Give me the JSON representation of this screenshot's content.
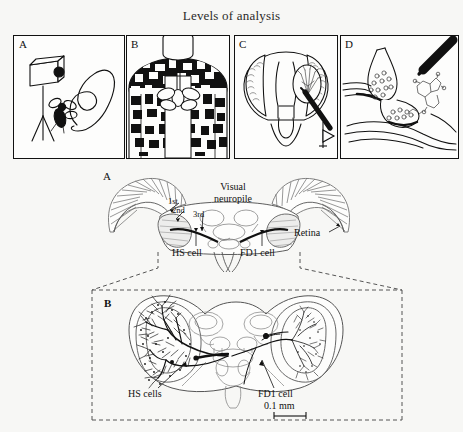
{
  "figure": {
    "title": "Levels of analysis",
    "background_color": "#f7f7f5",
    "ink_color": "#111111"
  },
  "top_row": {
    "panels": [
      {
        "letter": "A",
        "subject": "behaving-fly-with-camera",
        "contents": [
          "video-camera-on-tripod",
          "fly",
          "flight-trajectory-loop"
        ]
      },
      {
        "letter": "B",
        "subject": "fly-in-striped-flight-arena",
        "contents": [
          "rotating-drum",
          "random-checkerboard-pattern",
          "tethered-fly"
        ]
      },
      {
        "letter": "C",
        "subject": "electrophysiology-recording-from-brain",
        "contents": [
          "fly-head",
          "brain-neuropile",
          "recording-electrode",
          "output-arrow"
        ]
      },
      {
        "letter": "D",
        "subject": "synaptic-transmission",
        "contents": [
          "presynaptic-terminal",
          "synaptic-vesicles",
          "pipette",
          "neurotransmitter-molecule"
        ]
      }
    ]
  },
  "lower_figure": {
    "panel_a": {
      "letter": "A",
      "labels": {
        "visual_neuropile": "Visual\nneuropile",
        "visual_neuropile_line1": "Visual",
        "visual_neuropile_line2": "neuropile",
        "layer_1": "1st",
        "layer_2": "2nd",
        "layer_3": "3rd",
        "retina": "Retina",
        "hs_cell": "HS cell",
        "fd1_cell": "FD1 cell"
      }
    },
    "panel_b": {
      "letter": "B",
      "labels": {
        "hs_cells": "HS cells",
        "fd1_cell": "FD1 cell",
        "scale_bar": "0.1 mm"
      }
    }
  }
}
